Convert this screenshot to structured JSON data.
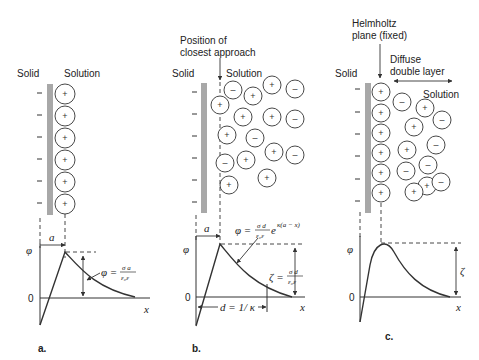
{
  "colors": {
    "solid_surface": "#a8a8a8",
    "ink": "#333333",
    "background": "#ffffff"
  },
  "panels": [
    {
      "id": "a",
      "caption": "a.",
      "solid_label": "Solid",
      "solution_label": "Solution",
      "surface_charges": [
        "–",
        "–",
        "–",
        "–",
        "–",
        "–"
      ],
      "ions": [
        {
          "x": 65,
          "y": 94,
          "sign": "+"
        },
        {
          "x": 65,
          "y": 116,
          "sign": "+"
        },
        {
          "x": 65,
          "y": 138,
          "sign": "+"
        },
        {
          "x": 65,
          "y": 160,
          "sign": "+"
        },
        {
          "x": 65,
          "y": 182,
          "sign": "+"
        },
        {
          "x": 65,
          "y": 204,
          "sign": "+"
        }
      ],
      "graph": {
        "y_axis_label": "φ",
        "x_axis_label": "x",
        "zero_label": "0",
        "distance_label": "a",
        "equation": {
          "lhs": "φ =",
          "numerator": "σ a",
          "denominator": "ε₀ε"
        }
      }
    },
    {
      "id": "b",
      "caption": "b.",
      "solid_label": "Solid",
      "solution_label": "Solution",
      "annotation": {
        "line1": "Position of",
        "line2": "closest approach"
      },
      "surface_charges": [
        "–",
        "–",
        "–",
        "–",
        "–",
        "–"
      ],
      "ions": [
        {
          "x": 220,
          "y": 105,
          "sign": "+"
        },
        {
          "x": 233,
          "y": 90,
          "sign": "–"
        },
        {
          "x": 253,
          "y": 96,
          "sign": "+"
        },
        {
          "x": 272,
          "y": 85,
          "sign": "+"
        },
        {
          "x": 295,
          "y": 89,
          "sign": "–"
        },
        {
          "x": 243,
          "y": 117,
          "sign": "+"
        },
        {
          "x": 272,
          "y": 117,
          "sign": "+"
        },
        {
          "x": 295,
          "y": 119,
          "sign": "–"
        },
        {
          "x": 227,
          "y": 135,
          "sign": "+"
        },
        {
          "x": 255,
          "y": 138,
          "sign": "–"
        },
        {
          "x": 274,
          "y": 152,
          "sign": "+"
        },
        {
          "x": 295,
          "y": 155,
          "sign": "–"
        },
        {
          "x": 225,
          "y": 163,
          "sign": "–"
        },
        {
          "x": 246,
          "y": 160,
          "sign": "+"
        },
        {
          "x": 267,
          "y": 178,
          "sign": "+"
        },
        {
          "x": 229,
          "y": 185,
          "sign": "+"
        }
      ],
      "graph": {
        "y_axis_label": "φ",
        "x_axis_label": "x",
        "zero_label": "0",
        "distance_label": "a",
        "equation": {
          "lhs": "φ =",
          "numerator": "σ d",
          "denominator": "ε₀ε",
          "exp_base": "e",
          "exponent": "κ(a − x)"
        },
        "zeta_equation": {
          "lhs": "ζ =",
          "numerator": "σ d",
          "denominator": "ε₀ε"
        },
        "debye_label": "d = 1/ κ"
      }
    },
    {
      "id": "c",
      "caption": "c.",
      "solid_label": "Solid",
      "solution_label": "Solution",
      "annotation": {
        "line1": "Helmholtz",
        "line2": "plane (fixed)"
      },
      "diffuse_label": {
        "line1": "Diffuse",
        "line2": "double layer"
      },
      "surface_charges": [
        "–",
        "–",
        "–",
        "–",
        "–",
        "–"
      ],
      "ions": [
        {
          "x": 381,
          "y": 92,
          "sign": "+"
        },
        {
          "x": 381,
          "y": 113,
          "sign": "+"
        },
        {
          "x": 381,
          "y": 133,
          "sign": "+"
        },
        {
          "x": 381,
          "y": 153,
          "sign": "+"
        },
        {
          "x": 381,
          "y": 173,
          "sign": "+"
        },
        {
          "x": 381,
          "y": 193,
          "sign": "+"
        },
        {
          "x": 402,
          "y": 102,
          "sign": "–"
        },
        {
          "x": 425,
          "y": 108,
          "sign": "+"
        },
        {
          "x": 442,
          "y": 120,
          "sign": "–"
        },
        {
          "x": 414,
          "y": 127,
          "sign": "+"
        },
        {
          "x": 436,
          "y": 145,
          "sign": "–"
        },
        {
          "x": 407,
          "y": 150,
          "sign": "+"
        },
        {
          "x": 428,
          "y": 165,
          "sign": "–"
        },
        {
          "x": 406,
          "y": 171,
          "sign": "–"
        },
        {
          "x": 427,
          "y": 186,
          "sign": "+"
        },
        {
          "x": 441,
          "y": 182,
          "sign": "–"
        },
        {
          "x": 414,
          "y": 192,
          "sign": "+"
        }
      ],
      "graph": {
        "y_axis_label": "φ",
        "x_axis_label": "x",
        "zero_label": "0",
        "zeta_label": "ζ"
      }
    }
  ]
}
